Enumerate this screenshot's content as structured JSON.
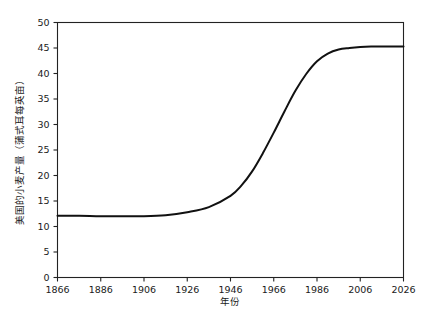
{
  "chart_data": {
    "type": "line",
    "title": "",
    "subtitle": "",
    "xlabel": "年份",
    "ylabel": "美国的小麦产量（蒲式耳每英亩）",
    "xlim": [
      1866,
      2026
    ],
    "ylim": [
      0,
      50
    ],
    "xticks": [
      1866,
      1886,
      1906,
      1926,
      1946,
      1966,
      1986,
      2006,
      2026
    ],
    "yticks": [
      0,
      5,
      10,
      15,
      20,
      25,
      30,
      35,
      40,
      45,
      50
    ],
    "xtick_labels": [
      "1866",
      "1886",
      "1906",
      "1926",
      "1946",
      "1966",
      "1986",
      "2006",
      "2026"
    ],
    "ytick_labels": [
      "0",
      "5",
      "10",
      "15",
      "20",
      "25",
      "30",
      "35",
      "40",
      "45",
      "50"
    ],
    "grid": false,
    "legend": null,
    "legend_position": "none",
    "annotations": [],
    "line_color": "#111111",
    "series": [
      {
        "name": "美国的小麦产量",
        "x": [
          1866,
          1876,
          1886,
          1896,
          1906,
          1916,
          1926,
          1936,
          1946,
          1951,
          1956,
          1961,
          1966,
          1971,
          1976,
          1981,
          1986,
          1991,
          1996,
          2001,
          2006,
          2011,
          2016,
          2026
        ],
        "values": [
          12.1,
          12.1,
          12.0,
          12.0,
          12.0,
          12.2,
          12.8,
          13.8,
          16.0,
          18.0,
          20.8,
          24.4,
          28.4,
          32.6,
          36.6,
          39.9,
          42.4,
          43.9,
          44.7,
          45.0,
          45.2,
          45.3,
          45.3,
          45.3
        ]
      }
    ]
  },
  "axes": {
    "x_axis_name": "year-axis",
    "y_axis_name": "wheat-yield-axis"
  }
}
